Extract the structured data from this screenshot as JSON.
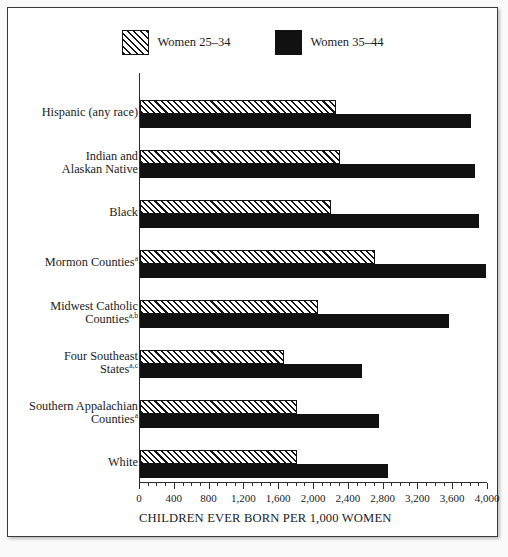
{
  "chart_data": {
    "type": "bar",
    "orientation": "horizontal",
    "title": "",
    "xlabel": "CHILDREN EVER BORN PER 1,000 WOMEN",
    "ylabel": "",
    "xlim": [
      0,
      4000
    ],
    "xticks": [
      0,
      400,
      800,
      1200,
      1600,
      2000,
      2400,
      2800,
      3200,
      3600,
      4000
    ],
    "xtick_labels": [
      "0",
      "400",
      "800",
      "1,200",
      "1,600",
      "2,000",
      "2,400",
      "2,800",
      "3,200",
      "3,600",
      "4,000"
    ],
    "minor_tick_step": 100,
    "grid": false,
    "legend_position": "top-center",
    "categories": [
      "Hispanic (any race)",
      "Indian and Alaskan Native",
      "Black",
      "Mormon Counties",
      "Midwest Catholic Counties",
      "Four Southeast States",
      "Southern Appalachian Counties",
      "White"
    ],
    "category_labels": [
      {
        "lines": [
          "Hispanic (any race)"
        ],
        "note": ""
      },
      {
        "lines": [
          "Indian and",
          "Alaskan Native"
        ],
        "note": ""
      },
      {
        "lines": [
          "Black"
        ],
        "note": ""
      },
      {
        "lines": [
          "Mormon Counties"
        ],
        "note": "a"
      },
      {
        "lines": [
          "Midwest Catholic",
          "Counties"
        ],
        "note": "a,b"
      },
      {
        "lines": [
          "Four Southeast",
          "States"
        ],
        "note": "a,c"
      },
      {
        "lines": [
          "Southern Appalachian",
          "Counties"
        ],
        "note": "a"
      },
      {
        "lines": [
          "White"
        ],
        "note": ""
      }
    ],
    "series": [
      {
        "name": "Women 25–34",
        "style": "hatched",
        "values": [
          2250,
          2300,
          2200,
          2700,
          2050,
          1650,
          1800,
          1800
        ]
      },
      {
        "name": "Women 35–44",
        "style": "solid",
        "values": [
          3800,
          3850,
          3900,
          3975,
          3550,
          2550,
          2750,
          2850
        ]
      }
    ]
  },
  "legend": {
    "items": [
      {
        "label": "Women 25–34",
        "swatch": "hatched"
      },
      {
        "label": "Women 35–44",
        "swatch": "solid"
      }
    ]
  },
  "axis": {
    "x_title": "CHILDREN EVER BORN PER 1,000 WOMEN"
  },
  "colors": {
    "bar_solid": "#111111",
    "bar_hatch_line": "#151515",
    "axis": "#2c2c2c",
    "text": "#1b1b1b",
    "frame": "#3a3a3a",
    "background": "#ffffff"
  }
}
